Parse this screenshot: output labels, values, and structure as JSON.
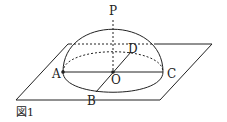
{
  "figure": {
    "caption": "図1",
    "points": {
      "P": "P",
      "A": "A",
      "B": "B",
      "C": "C",
      "D": "D",
      "O": "O"
    },
    "colors": {
      "stroke": "#222222",
      "background": "#ffffff"
    }
  }
}
